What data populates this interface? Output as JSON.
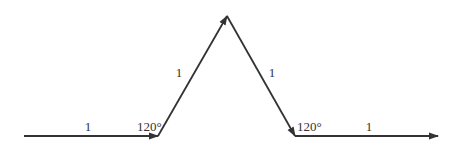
{
  "diagram": {
    "type": "koch-curve-generator",
    "stroke_color": "#333333",
    "segments": [
      {
        "name": "segment-1",
        "label": "1",
        "from": [
          24,
          136
        ],
        "to": [
          158,
          136
        ],
        "label_pos": [
          88,
          131
        ]
      },
      {
        "name": "segment-2",
        "label": "1",
        "from": [
          158,
          136
        ],
        "to": [
          227,
          16
        ],
        "label_pos": [
          178,
          77
        ]
      },
      {
        "name": "segment-3",
        "label": "1",
        "from": [
          227,
          16
        ],
        "to": [
          295,
          136
        ],
        "label_pos": [
          272,
          77
        ]
      },
      {
        "name": "segment-4",
        "label": "1",
        "from": [
          295,
          136
        ],
        "to": [
          438,
          136
        ],
        "label_pos": [
          369,
          131
        ]
      }
    ],
    "angles": [
      {
        "name": "angle-left",
        "label": "120°",
        "pos": [
          137,
          131
        ]
      },
      {
        "name": "angle-right",
        "label": "120°",
        "pos": [
          297,
          131
        ]
      }
    ]
  }
}
